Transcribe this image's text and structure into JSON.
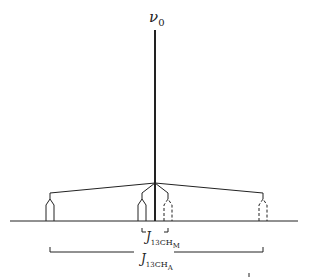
{
  "diagram": {
    "type": "NMR splitting tree",
    "center_label": {
      "symbol": "ν",
      "subscript": "0"
    },
    "coupling_labels": {
      "inner": {
        "symbol": "J",
        "isotope": "13",
        "group": "CH",
        "subscript": "M"
      },
      "outer": {
        "symbol": "J",
        "isotope": "13",
        "group": "CH",
        "subscript": "A"
      }
    },
    "peaks": [
      {
        "name": "outer-left",
        "style": "solid"
      },
      {
        "name": "inner-left",
        "style": "solid"
      },
      {
        "name": "inner-right",
        "style": "dashed"
      },
      {
        "name": "outer-right",
        "style": "dashed"
      }
    ],
    "colors": {
      "line": "#222222",
      "background": "#ffffff"
    }
  }
}
